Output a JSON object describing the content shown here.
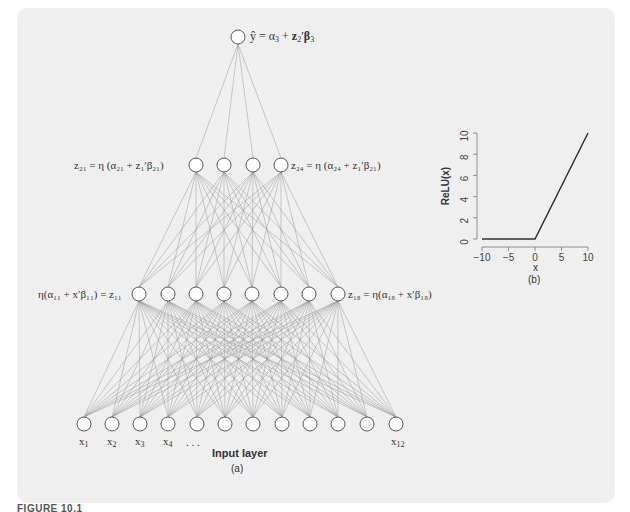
{
  "figure": {
    "caption": "FIGURE 10.1",
    "panel_a_label": "(a)",
    "panel_b_label": "(b)"
  },
  "network": {
    "output_label": {
      "lhs": "ŷ",
      "rest": " = α",
      "sub1": "3",
      "plus": " + ",
      "bold": "z",
      "sub2": "2",
      "prime": "′",
      "beta": "β",
      "sub3": "3"
    },
    "hidden2_left_label": "z₂₁ = η (α₂₁ + z₁′β₂₁)",
    "hidden2_right_label": "z₂₄ = η (α₂₄ + z₁′β₂₁)",
    "hidden1_left_label": "η(α₁₁ + x′β₁₁) = z₁₁",
    "hidden1_right_label": "z₁₈ = η(α₁₈ + x′β₁₈)",
    "input_layer_title": "Input layer",
    "input_labels": [
      {
        "text": "x",
        "sub": "1",
        "x": 84
      },
      {
        "text": "x",
        "sub": "2",
        "x": 112
      },
      {
        "text": "x",
        "sub": "3",
        "x": 140
      },
      {
        "text": "x",
        "sub": "4",
        "x": 168
      },
      {
        "text": "x",
        "sub": "12",
        "x": 396
      }
    ],
    "ellipsis": ". . .",
    "layers": {
      "output": {
        "y": 37,
        "x": [
          238
        ]
      },
      "hidden2": {
        "y": 165,
        "x": [
          196,
          224,
          253,
          281
        ]
      },
      "hidden1": {
        "y": 294,
        "x": [
          139,
          168,
          196,
          224,
          252,
          281,
          309,
          338
        ]
      },
      "input": {
        "y": 424,
        "x": [
          84,
          112,
          140,
          168,
          197,
          225,
          253,
          282,
          310,
          338,
          367,
          396
        ]
      }
    },
    "node_radius": 7,
    "colors": {
      "node_stroke": "#555555",
      "node_fill": "#ffffff",
      "edge": "#9a9a9a"
    }
  },
  "chart_data": {
    "type": "line",
    "title": "",
    "xlabel": "x",
    "ylabel": "ReLU(x)",
    "x": [
      -10,
      0,
      10
    ],
    "values": [
      0,
      0,
      10
    ],
    "xlim": [
      -10,
      10
    ],
    "ylim": [
      0,
      10
    ],
    "xticks": [
      "−10",
      "−5",
      "0",
      "5",
      "10"
    ],
    "yticks": [
      "0",
      "2",
      "4",
      "6",
      "8",
      "10"
    ],
    "grid": false,
    "legend": null
  }
}
